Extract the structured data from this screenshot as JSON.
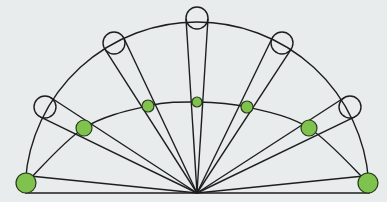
{
  "diagram": {
    "type": "semicircular-ray-diagram",
    "background": "#e9ecec",
    "stroke_color": "#1e1e1e",
    "fill_green": "#7fc24e",
    "apex": {
      "x": 197,
      "y": 193
    },
    "baseline": {
      "x1": 25,
      "x2": 370,
      "y": 193
    },
    "outer_arc": {
      "cx": 197,
      "cy": 193,
      "rx": 172,
      "ry": 171
    },
    "inner_arc_points": [
      [
        26,
        183
      ],
      [
        84,
        128
      ],
      [
        148,
        106
      ],
      [
        197,
        102
      ],
      [
        247,
        107
      ],
      [
        309,
        128
      ],
      [
        368,
        183
      ]
    ],
    "open_circles": [
      {
        "x": 45,
        "y": 107,
        "r": 11
      },
      {
        "x": 114,
        "y": 43,
        "r": 11
      },
      {
        "x": 197,
        "y": 18,
        "r": 11
      },
      {
        "x": 282,
        "y": 43,
        "r": 11
      },
      {
        "x": 350,
        "y": 107,
        "r": 11
      }
    ],
    "green_dots": [
      {
        "x": 26,
        "y": 183,
        "r": 10
      },
      {
        "x": 84,
        "y": 128,
        "r": 8
      },
      {
        "x": 148,
        "y": 106,
        "r": 6
      },
      {
        "x": 197,
        "y": 102,
        "r": 5
      },
      {
        "x": 247,
        "y": 107,
        "r": 6
      },
      {
        "x": 309,
        "y": 128,
        "r": 8
      },
      {
        "x": 368,
        "y": 183,
        "r": 10
      }
    ]
  }
}
